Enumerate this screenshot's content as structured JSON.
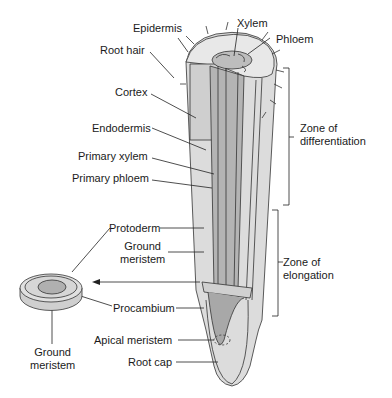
{
  "labels": {
    "epidermis": "Epidermis",
    "root_hair": "Root hair",
    "xylem": "Xylem",
    "phloem": "Phloem",
    "cortex": "Cortex",
    "endodermis": "Endodermis",
    "primary_xylem": "Primary xylem",
    "primary_phloem": "Primary phloem",
    "zone_diff_1": "Zone of",
    "zone_diff_2": "differentiation",
    "protoderm": "Protoderm",
    "ground_meristem_1": "Ground",
    "ground_meristem_2": "meristem",
    "zone_elong_1": "Zone of",
    "zone_elong_2": "elongation",
    "procambium": "Procambium",
    "apical_meristem": "Apical meristem",
    "root_cap": "Root cap",
    "disc_ground_1": "Ground",
    "disc_ground_2": "meristem"
  },
  "colors": {
    "outer": "#d9d9d9",
    "mid": "#c4c4c4",
    "inner": "#a8a8a8",
    "light": "#ececec",
    "line": "#333333"
  }
}
